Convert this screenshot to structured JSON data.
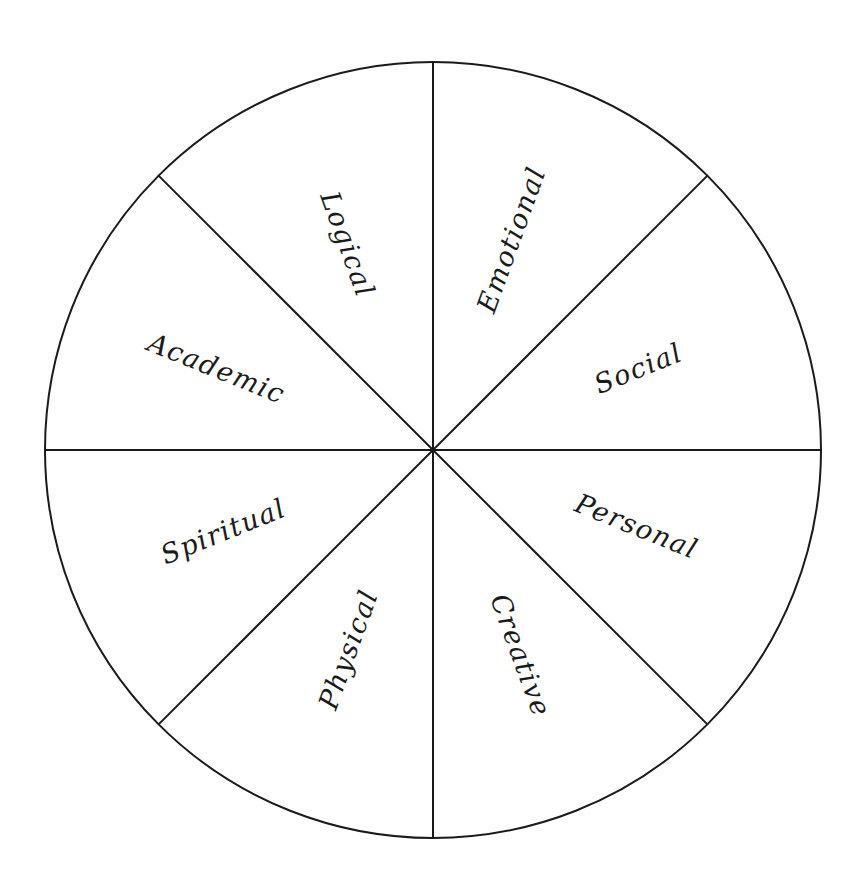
{
  "diagram": {
    "type": "wheel",
    "segments": 8,
    "colors": {
      "stroke": "#1a1a1a",
      "background": "#ffffff",
      "text": "#1a1a1a"
    },
    "labels": {
      "logical": "Logical",
      "emotional": "Emotional",
      "academic": "Academic",
      "social": "Social",
      "spiritual": "Spiritual",
      "personal": "Personal",
      "physical": "Physical",
      "creative": "Creative"
    }
  }
}
